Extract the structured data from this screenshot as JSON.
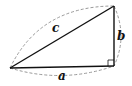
{
  "diagram": {
    "type": "right-triangle",
    "labels": {
      "hypotenuse": "c",
      "vertical_leg": "b",
      "horizontal_leg": "a"
    },
    "colors": {
      "stroke": "#111111",
      "dashed": "#888888",
      "background": "#ffffff"
    }
  }
}
